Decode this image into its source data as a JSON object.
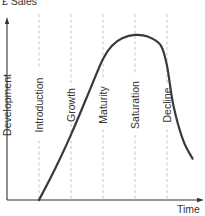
{
  "chart_data": {
    "type": "line",
    "ylabel": "£ Sales",
    "xlabel": "Time",
    "stages": [
      "Development",
      "Introduction",
      "Growth",
      "Maturity",
      "Saturation",
      "Decline"
    ],
    "grid": false,
    "x_range": [
      0,
      6
    ],
    "y_range": [
      0,
      100
    ],
    "series": [
      {
        "name": "Sales",
        "x": [
          1.0,
          1.5,
          2.0,
          2.5,
          3.0,
          3.3,
          3.6,
          4.0,
          4.4,
          4.8,
          5.0,
          5.2,
          5.5,
          5.8
        ],
        "values": [
          0,
          18,
          38,
          60,
          82,
          90,
          94,
          96,
          95,
          90,
          78,
          55,
          35,
          24
        ]
      }
    ],
    "colors": {
      "axis": "#333333",
      "curve": "#3a3a3a",
      "stage_divider": "#b8b8b8",
      "text": "#333333"
    }
  }
}
